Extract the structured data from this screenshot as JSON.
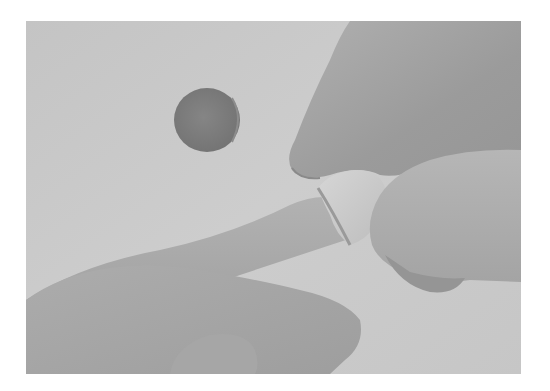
{
  "image": {
    "description": "Grayscale photograph: a hand slides a white fabric ring onto an extended finger; a dark round disc lies on the light surface in the background",
    "palette": {
      "page_background": "#ffffff",
      "surface": "#c9c9c9",
      "surface_light": "#d2d2d2",
      "disc": "#7e7e7e",
      "disc_edge": "#6f6f6f",
      "skin_dark": "#9d9d9d",
      "skin_mid": "#a9a9a9",
      "skin_light": "#b4b4b4",
      "ring": "#cfcfcf",
      "ring_shadow": "#a2a2a2"
    },
    "objects": [
      {
        "name": "disc",
        "center": [
          207,
          120
        ],
        "size": [
          67,
          65
        ]
      },
      {
        "name": "upper-hand",
        "region": "top-right"
      },
      {
        "name": "extended-finger",
        "region": "center-left to center"
      },
      {
        "name": "fabric-ring",
        "center": [
          348,
          200
        ]
      },
      {
        "name": "lower-hand",
        "region": "bottom-left"
      },
      {
        "name": "thumb",
        "region": "right, below ring"
      }
    ]
  }
}
